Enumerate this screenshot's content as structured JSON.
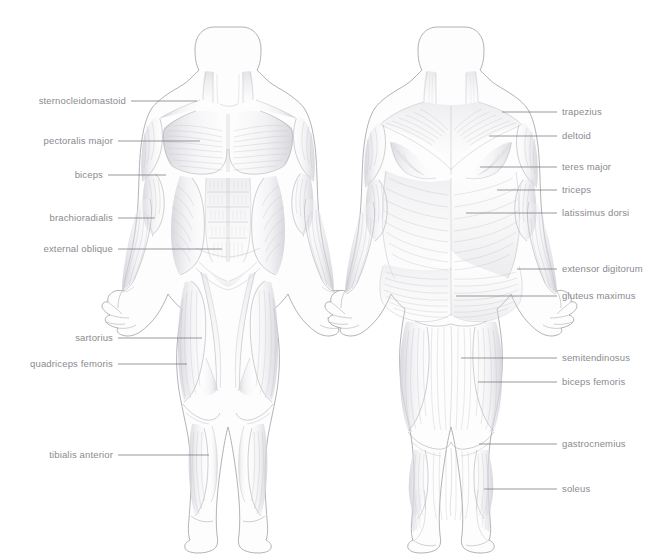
{
  "figure": {
    "title": "",
    "background_color": "#ffffff",
    "text_color": "#8a8a8f",
    "leader_color": "#6f6f77",
    "outline_color": "#9a9aa0"
  },
  "views": {
    "anterior": {
      "name": "anterior-muscle-figure"
    },
    "posterior": {
      "name": "posterior-muscle-figure"
    }
  },
  "labels_left": [
    {
      "id": "sternocleidomastoid",
      "text": "sternocleidomastoid",
      "text_x": 126,
      "text_y": 104,
      "line_x1": 131,
      "line_y1": 101,
      "line_x2": 197,
      "line_y2": 101
    },
    {
      "id": "pectoralis-major",
      "text": "pectoralis major",
      "text_x": 113,
      "text_y": 144,
      "line_x1": 118,
      "line_y1": 141,
      "line_x2": 200,
      "line_y2": 141
    },
    {
      "id": "biceps",
      "text": "biceps",
      "text_x": 103,
      "text_y": 178,
      "line_x1": 108,
      "line_y1": 175,
      "line_x2": 166,
      "line_y2": 175
    },
    {
      "id": "brachioradialis",
      "text": "brachioradialis",
      "text_x": 113,
      "text_y": 221,
      "line_x1": 118,
      "line_y1": 218,
      "line_x2": 155,
      "line_y2": 218
    },
    {
      "id": "external-oblique",
      "text": "external oblique",
      "text_x": 113,
      "text_y": 252,
      "line_x1": 118,
      "line_y1": 249,
      "line_x2": 222,
      "line_y2": 249
    },
    {
      "id": "sartorius",
      "text": "sartorius",
      "text_x": 113,
      "text_y": 341,
      "line_x1": 118,
      "line_y1": 338,
      "line_x2": 202,
      "line_y2": 338
    },
    {
      "id": "quadriceps-femoris",
      "text": "quadriceps femoris",
      "text_x": 113,
      "text_y": 367,
      "line_x1": 118,
      "line_y1": 364,
      "line_x2": 187,
      "line_y2": 364
    },
    {
      "id": "tibialis-anterior",
      "text": "tibialis anterior",
      "text_x": 113,
      "text_y": 458,
      "line_x1": 118,
      "line_y1": 455,
      "line_x2": 209,
      "line_y2": 455
    }
  ],
  "labels_right": [
    {
      "id": "trapezius",
      "text": "trapezius",
      "text_x": 562,
      "text_y": 115,
      "line_x1": 502,
      "line_y1": 112,
      "line_x2": 557,
      "line_y2": 112
    },
    {
      "id": "deltoid",
      "text": "deltoid",
      "text_x": 562,
      "text_y": 139,
      "line_x1": 489,
      "line_y1": 136,
      "line_x2": 557,
      "line_y2": 136
    },
    {
      "id": "teres-major",
      "text": "teres major",
      "text_x": 562,
      "text_y": 170,
      "line_x1": 480,
      "line_y1": 167,
      "line_x2": 557,
      "line_y2": 167
    },
    {
      "id": "triceps",
      "text": "triceps",
      "text_x": 562,
      "text_y": 193,
      "line_x1": 497,
      "line_y1": 190,
      "line_x2": 557,
      "line_y2": 190
    },
    {
      "id": "latissimus-dorsi",
      "text": "latissimus dorsi",
      "text_x": 562,
      "text_y": 216,
      "line_x1": 466,
      "line_y1": 213,
      "line_x2": 557,
      "line_y2": 213
    },
    {
      "id": "extensor-digitorum",
      "text": "extensor digitorum",
      "text_x": 562,
      "text_y": 272,
      "line_x1": 517,
      "line_y1": 269,
      "line_x2": 557,
      "line_y2": 269
    },
    {
      "id": "gluteus-maximus",
      "text": "gluteus maximus",
      "text_x": 562,
      "text_y": 299,
      "line_x1": 456,
      "line_y1": 296,
      "line_x2": 557,
      "line_y2": 296
    },
    {
      "id": "semitendinosus",
      "text": "semitendinosus",
      "text_x": 562,
      "text_y": 361,
      "line_x1": 461,
      "line_y1": 358,
      "line_x2": 557,
      "line_y2": 358
    },
    {
      "id": "biceps-femoris",
      "text": "biceps femoris",
      "text_x": 562,
      "text_y": 385,
      "line_x1": 478,
      "line_y1": 382,
      "line_x2": 557,
      "line_y2": 382
    },
    {
      "id": "gastrocnemius",
      "text": "gastrocnemius",
      "text_x": 562,
      "text_y": 447,
      "line_x1": 479,
      "line_y1": 444,
      "line_x2": 557,
      "line_y2": 444
    },
    {
      "id": "soleus",
      "text": "soleus",
      "text_x": 562,
      "text_y": 492,
      "line_x1": 484,
      "line_y1": 489,
      "line_x2": 557,
      "line_y2": 489
    }
  ]
}
